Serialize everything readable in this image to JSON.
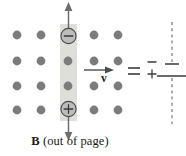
{
  "figure": {
    "background_color": "#ffffff"
  },
  "field_region": {
    "name": "magnetic-field-out-of-page",
    "dot_color": "#7c7c7c",
    "dot_radius": 4.4,
    "rows": 4,
    "columns": 5,
    "dot_positions": [
      {
        "x": 17,
        "y": 35
      },
      {
        "x": 41,
        "y": 35
      },
      {
        "x": 68,
        "y": 35
      },
      {
        "x": 94,
        "y": 35
      },
      {
        "x": 118,
        "y": 35
      },
      {
        "x": 17,
        "y": 61
      },
      {
        "x": 41,
        "y": 61
      },
      {
        "x": 68,
        "y": 61
      },
      {
        "x": 94,
        "y": 61
      },
      {
        "x": 118,
        "y": 61
      },
      {
        "x": 17,
        "y": 86
      },
      {
        "x": 41,
        "y": 86
      },
      {
        "x": 68,
        "y": 86
      },
      {
        "x": 94,
        "y": 86
      },
      {
        "x": 118,
        "y": 86
      },
      {
        "x": 17,
        "y": 110
      },
      {
        "x": 41,
        "y": 110
      },
      {
        "x": 68,
        "y": 110
      },
      {
        "x": 94,
        "y": 110
      },
      {
        "x": 118,
        "y": 110
      }
    ]
  },
  "bar": {
    "name": "conducting-bar",
    "fill_color": "#d8d8d4",
    "x": 60,
    "y": 24,
    "width": 17,
    "height": 97
  },
  "charges": {
    "negative": {
      "symbol": "−",
      "label": "negative-charge",
      "cx": 68.5,
      "cy": 36,
      "r": 7.6
    },
    "positive": {
      "symbol": "+",
      "label": "positive-charge",
      "cx": 68.5,
      "cy": 109,
      "r": 7.6
    }
  },
  "force_arrows": {
    "up": {
      "label": "force-on-negative-charge-up",
      "from_y": 36,
      "to_y": 3
    },
    "down": {
      "label": "force-on-positive-charge-down",
      "from_y": 109,
      "to_y": 140
    },
    "color": "#6e6e6e"
  },
  "velocity": {
    "label": "v",
    "name": "velocity-vector",
    "arrow_from_x": 84,
    "arrow_to_x": 113,
    "arrow_y": 70,
    "color": "#4c4c4c"
  },
  "equals": {
    "symbol": "=",
    "name": "equals-sign",
    "x": 128,
    "y": 71
  },
  "capacitor": {
    "name": "equivalent-capacitor",
    "top_sign": "−",
    "bottom_sign": "+",
    "top_plate": {
      "x1": 165,
      "x2": 179,
      "y": 64
    },
    "bottom_plate": {
      "x1": 157,
      "x2": 186,
      "y": 76
    },
    "wire_x": 172,
    "wire_top_y": 22,
    "wire_bottom_y": 124,
    "plate_color": "#5a5a5a",
    "wire_color": "#6a6a6a"
  },
  "caption": {
    "name": "field-caption",
    "symbol": "B",
    "text": " (out of page)",
    "full_text": "B (out of page)"
  }
}
